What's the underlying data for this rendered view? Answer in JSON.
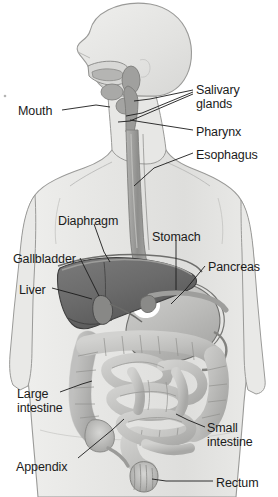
{
  "figure": {
    "palette": {
      "background": "#ffffff",
      "body_fill": "#e4e4e2",
      "body_fill_light": "#eeeeec",
      "body_outline": "#8d8d8b",
      "liver": "#6f6f6f",
      "liver_dark": "#5a5a5a",
      "stomach": "#b9b9b7",
      "stomach_highlight": "#ffffff",
      "intestine": "#c6c6c4",
      "intestine_shade": "#9a9a98",
      "esophagus": "#9d9d9b",
      "gland": "#a8a8a6",
      "leader_line": "#1b1b1b",
      "label_text": "#1b1b1b"
    },
    "speck_artifact": true
  },
  "labels": [
    {
      "id": "mouth",
      "text": "Mouth",
      "lines": [
        "Mouth"
      ],
      "x": 18,
      "y": 105,
      "align": "left"
    },
    {
      "id": "salivary-glands",
      "text": "Salivary glands",
      "lines": [
        "Salivary",
        "glands"
      ],
      "x": 196,
      "y": 84,
      "align": "left"
    },
    {
      "id": "pharynx",
      "text": "Pharynx",
      "lines": [
        "Pharynx"
      ],
      "x": 196,
      "y": 126,
      "align": "left"
    },
    {
      "id": "esophagus",
      "text": "Esophagus",
      "lines": [
        "Esophagus"
      ],
      "x": 196,
      "y": 149,
      "align": "left"
    },
    {
      "id": "diaphragm",
      "text": "Diaphragm",
      "lines": [
        "Diaphragm"
      ],
      "x": 58,
      "y": 215,
      "align": "left"
    },
    {
      "id": "stomach",
      "text": "Stomach",
      "lines": [
        "Stomach"
      ],
      "x": 152,
      "y": 231,
      "align": "left"
    },
    {
      "id": "gallbladder",
      "text": "Gallbladder",
      "lines": [
        "Gallbladder"
      ],
      "x": 13,
      "y": 253,
      "align": "left"
    },
    {
      "id": "pancreas",
      "text": "Pancreas",
      "lines": [
        "Pancreas"
      ],
      "x": 208,
      "y": 261,
      "align": "left"
    },
    {
      "id": "liver",
      "text": "Liver",
      "lines": [
        "Liver"
      ],
      "x": 19,
      "y": 284,
      "align": "left"
    },
    {
      "id": "large-intestine",
      "text": "Large intestine",
      "lines": [
        "Large",
        "intestine"
      ],
      "x": 17,
      "y": 388,
      "align": "left"
    },
    {
      "id": "small-intestine",
      "text": "Small intestine",
      "lines": [
        "Small",
        "intestine"
      ],
      "x": 207,
      "y": 422,
      "align": "left"
    },
    {
      "id": "appendix",
      "text": "Appendix",
      "lines": [
        "Appendix"
      ],
      "x": 16,
      "y": 461,
      "align": "left"
    },
    {
      "id": "rectum",
      "text": "Rectum",
      "lines": [
        "Rectum"
      ],
      "x": 216,
      "y": 477,
      "align": "left"
    }
  ],
  "leader_lines": [
    {
      "id": "mouth",
      "points": "62,110 96,105 110,107"
    },
    {
      "id": "salivary-gland-1",
      "points": "193,90 150,99 134,101"
    },
    {
      "id": "salivary-gland-2",
      "points": "193,92 142,113 126,116"
    },
    {
      "id": "salivary-gland-3",
      "points": "193,94 130,121 118,122"
    },
    {
      "id": "pharynx",
      "points": "193,130 142,122 130,120"
    },
    {
      "id": "esophagus",
      "points": "193,153 154,168 134,186"
    },
    {
      "id": "diaphragm",
      "points": "94,224 104,252 110,262"
    },
    {
      "id": "stomach",
      "points": "176,240 176,290"
    },
    {
      "id": "gallbladder",
      "points": "80,258 92,282 99,296"
    },
    {
      "id": "liver",
      "points": "52,288 78,295 92,299"
    },
    {
      "id": "pancreas",
      "points": "205,266 186,289 171,304"
    },
    {
      "id": "large-intestine",
      "points": "60,392 82,384 92,381"
    },
    {
      "id": "small-intestine",
      "points": "205,427 188,420 176,414"
    },
    {
      "id": "appendix",
      "points": "78,458 112,430 124,419"
    },
    {
      "id": "rectum",
      "points": "213,481 166,481 152,479"
    }
  ],
  "organs": [
    {
      "id": "head",
      "name": "head"
    },
    {
      "id": "neck",
      "name": "neck"
    },
    {
      "id": "torso",
      "name": "torso"
    },
    {
      "id": "left-arm",
      "name": "left-arm"
    },
    {
      "id": "right-arm",
      "name": "right-arm"
    },
    {
      "id": "oral-cavity",
      "name": "oral-cavity"
    },
    {
      "id": "tongue",
      "name": "tongue"
    },
    {
      "id": "parotid-gland",
      "name": "parotid-gland"
    },
    {
      "id": "sublingual-gland",
      "name": "sublingual-gland"
    },
    {
      "id": "submandibular-gland",
      "name": "submandibular-gland"
    },
    {
      "id": "pharynx-organ",
      "name": "pharynx"
    },
    {
      "id": "esophagus-organ",
      "name": "esophagus"
    },
    {
      "id": "liver-organ",
      "name": "liver"
    },
    {
      "id": "gallbladder-organ",
      "name": "gallbladder"
    },
    {
      "id": "stomach-organ",
      "name": "stomach"
    },
    {
      "id": "pancreas-organ",
      "name": "pancreas"
    },
    {
      "id": "large-intestine-organ",
      "name": "large-intestine"
    },
    {
      "id": "small-intestine-organ",
      "name": "small-intestine"
    },
    {
      "id": "appendix-organ",
      "name": "appendix"
    },
    {
      "id": "rectum-organ",
      "name": "rectum"
    }
  ]
}
